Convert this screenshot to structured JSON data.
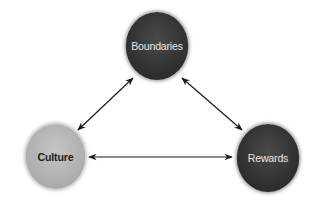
{
  "diagram": {
    "type": "triangle-relationship",
    "nodes": [
      {
        "id": "boundaries",
        "label": "Boundaries",
        "shade": "dark"
      },
      {
        "id": "culture",
        "label": "Culture",
        "shade": "light"
      },
      {
        "id": "rewards",
        "label": "Rewards",
        "shade": "dark"
      }
    ],
    "edges": [
      {
        "from": "boundaries",
        "to": "culture",
        "direction": "bidirectional"
      },
      {
        "from": "boundaries",
        "to": "rewards",
        "direction": "bidirectional"
      },
      {
        "from": "culture",
        "to": "rewards",
        "direction": "bidirectional"
      }
    ],
    "colors": {
      "dark_node": "#333333",
      "light_node": "#b0b0b0",
      "arrow": "#1a1a1a",
      "background": "#ffffff"
    }
  }
}
